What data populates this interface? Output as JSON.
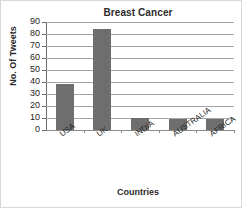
{
  "chart_data": {
    "type": "bar",
    "title": "Breast Cancer",
    "xlabel": "Countries",
    "ylabel": "No. Of Tweets",
    "categories": [
      "USA",
      "UK",
      "INDIA",
      "AUSTRALIA",
      "AFRICA"
    ],
    "values": [
      38,
      84,
      10,
      9,
      9
    ],
    "ylim": [
      0,
      90
    ],
    "ytick_step": 10,
    "yticks": [
      0,
      10,
      20,
      30,
      40,
      50,
      60,
      70,
      80,
      90
    ],
    "ytick_labels": [
      "0",
      "10",
      "20",
      "30",
      "40",
      "50",
      "60",
      "70",
      "80",
      "90"
    ],
    "grid": true,
    "legend": false,
    "bar_color": "#6e6e6e",
    "gridline_color": "#a6a6a6",
    "axis_color": "#6d6d6d",
    "background": "#ffffff"
  }
}
